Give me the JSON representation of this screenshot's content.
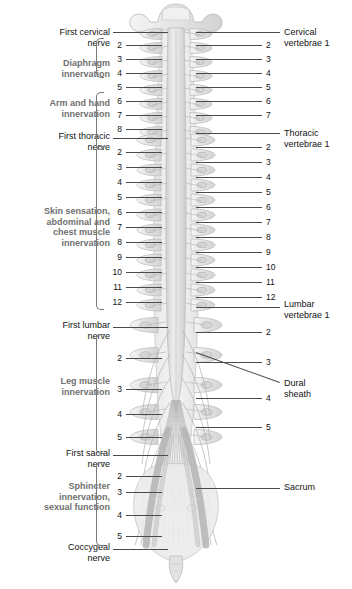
{
  "figure": {
    "colors": {
      "label_text": "#111111",
      "group_label_text": "#6f6f6f",
      "leader_line": "#4a4a4a",
      "bone_fill": "#e9e9e9",
      "bone_stroke": "#b8b8b8",
      "cord_fill": "#dcdcdc",
      "nerve_stroke": "#a9a9a9",
      "dura_fill": "#efefef",
      "background": "#ffffff"
    }
  },
  "left_labels": [
    {
      "id": "first-cervical-nerve",
      "text": "First cervical\nnerve"
    },
    {
      "id": "first-thoracic-nerve",
      "text": "First thoracic\nnerve"
    },
    {
      "id": "first-lumbar-nerve",
      "text": "First lumbar\nnerve"
    },
    {
      "id": "first-sacral-nerve",
      "text": "First sacral\nnerve"
    },
    {
      "id": "coccygeal-nerve",
      "text": "Coccygeal\nnerve"
    }
  ],
  "left_group_labels": [
    {
      "id": "diaphragm-innervation",
      "text": "Diaphragm\ninnervation"
    },
    {
      "id": "arm-and-hand-innervation",
      "text": "Arm and hand\ninnervation"
    },
    {
      "id": "skin-sensation-group",
      "text": "Skin sensation,\nabdominal and\nchest muscle\ninnervation"
    },
    {
      "id": "leg-muscle-innervation",
      "text": "Leg muscle\ninnervation"
    },
    {
      "id": "sphincter-innervation",
      "text": "Sphincter\ninnervation,\nsexual function"
    }
  ],
  "right_labels": [
    {
      "id": "cervical-vertebrae-1",
      "text": "Cervical\nvertebrae 1"
    },
    {
      "id": "thoracic-vertebrae-1",
      "text": "Thoracic\nvertebrae 1"
    },
    {
      "id": "lumbar-vertebrae-1",
      "text": "Lumbar\nvertebrae 1"
    },
    {
      "id": "dural-sheath",
      "text": "Dural\nsheath"
    },
    {
      "id": "sacrum",
      "text": "Sacrum"
    }
  ],
  "left_nerve_numbers": {
    "cervical": [
      "2",
      "3",
      "4",
      "5",
      "6",
      "7",
      "8"
    ],
    "thoracic": [
      "2",
      "3",
      "4",
      "5",
      "6",
      "7",
      "8",
      "9",
      "10",
      "11",
      "12"
    ],
    "lumbar": [
      "2",
      "3",
      "4",
      "5"
    ],
    "sacral": [
      "2",
      "3",
      "4",
      "5"
    ]
  },
  "right_vertebra_numbers": {
    "cervical": [
      "2",
      "3",
      "4",
      "5",
      "6",
      "7"
    ],
    "thoracic": [
      "2",
      "3",
      "4",
      "5",
      "6",
      "7",
      "8",
      "9",
      "10",
      "11",
      "12"
    ],
    "lumbar": [
      "2",
      "3",
      "4",
      "5"
    ]
  }
}
